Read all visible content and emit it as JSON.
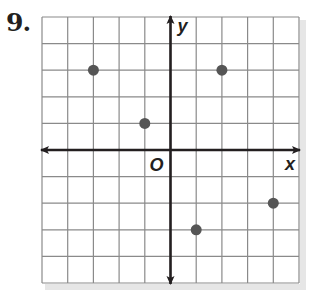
{
  "problem": {
    "number_label": "9."
  },
  "colors": {
    "grid": "#8a8a8a",
    "axis": "#231f20",
    "point": "#555555",
    "shadow": "#e6e6e6"
  },
  "chart_data": {
    "type": "scatter",
    "title": "",
    "xlabel": "x",
    "ylabel": "y",
    "origin_label": "O",
    "xlim": [
      -5,
      5
    ],
    "ylim": [
      -5,
      5
    ],
    "grid": true,
    "tick_labels": false,
    "legend": null,
    "points": [
      {
        "x": -3,
        "y": 3
      },
      {
        "x": -1,
        "y": 1
      },
      {
        "x": 2,
        "y": 3
      },
      {
        "x": 1,
        "y": -3
      },
      {
        "x": 4,
        "y": -2
      }
    ]
  }
}
